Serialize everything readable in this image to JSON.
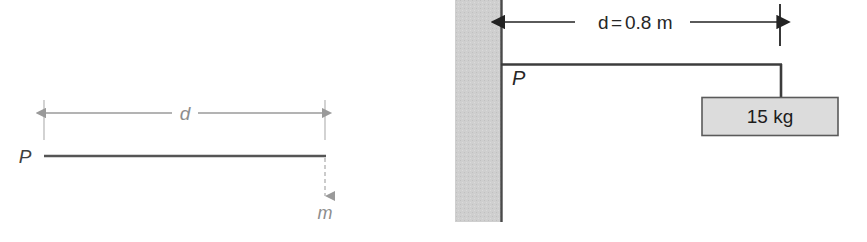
{
  "figure": {
    "background_color": "#ffffff",
    "panels": [
      {
        "id": "left-panel",
        "name": "generic-cantilever-schematic",
        "point_label": "P",
        "distance_label": "d",
        "mass_label": "m",
        "beam_color": "#555555",
        "dimension_color": "#9a9a9a",
        "load_line_style": "dashed"
      },
      {
        "id": "right-panel",
        "name": "wall-mounted-cantilever-with-load",
        "point_label": "P",
        "distance_label": "d = 0.8 m",
        "distance_symbol": "d",
        "distance_equals": "=",
        "distance_value": "0.8 m",
        "block_label": "15 kg",
        "wall_fill_color": "#cfcfcf",
        "wall_edge_color": "#4a4a4a",
        "beam_color": "#3c3c3c",
        "block_fill_color": "#dcdcdc",
        "block_border_color": "#5a5a5a",
        "dimension_color": "#232323"
      }
    ]
  }
}
